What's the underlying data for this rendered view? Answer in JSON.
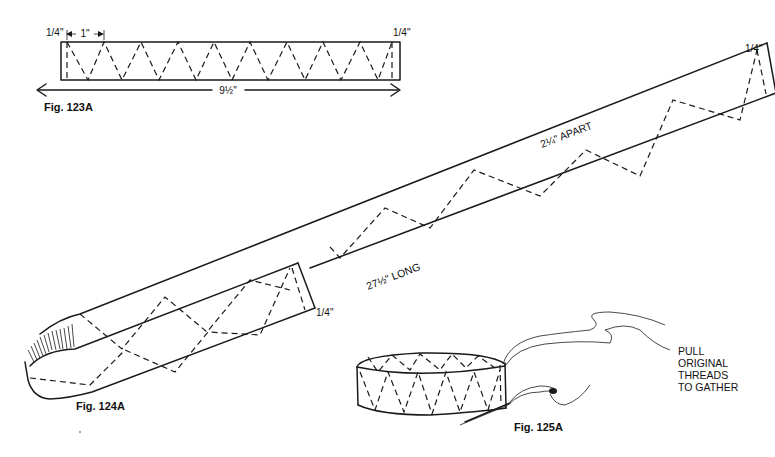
{
  "figures": [
    {
      "id": "fig123a",
      "caption": "Fig. 123A",
      "labels": {
        "left_seam": "1/4\"",
        "right_seam": "1/4\"",
        "zigzag_spacing": "1\"",
        "length": "9½\""
      }
    },
    {
      "id": "fig124a",
      "caption": "Fig. 124A",
      "labels": {
        "top_seam": "1/4\"",
        "apart": "2¼\" APART",
        "long": "27½\" LONG",
        "end_seam": "1/4\""
      }
    },
    {
      "id": "fig125a",
      "caption": "Fig. 125A",
      "labels": {
        "instruction_lines": [
          "PULL",
          "ORIGINAL",
          "THREADS",
          "TO GATHER"
        ]
      }
    }
  ],
  "colors": {
    "ink": "#1a1a1a",
    "paper": "#ffffff"
  }
}
